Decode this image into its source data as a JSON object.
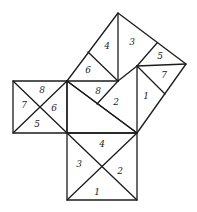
{
  "diagram": {
    "type": "pythagorean-dissection",
    "stroke_color": "#1c1c1c",
    "background": "#ffffff",
    "squares": {
      "hypotenuse_square": {
        "pieces": [
          {
            "id": "hyp-1",
            "label": "1",
            "x": 146,
            "y": 96
          },
          {
            "id": "hyp-2",
            "label": "2",
            "x": 116,
            "y": 102
          },
          {
            "id": "hyp-3",
            "label": "3",
            "x": 132,
            "y": 42
          },
          {
            "id": "hyp-4",
            "label": "4",
            "x": 107,
            "y": 46
          },
          {
            "id": "hyp-5",
            "label": "5",
            "x": 160,
            "y": 56
          },
          {
            "id": "hyp-6",
            "label": "6",
            "x": 88,
            "y": 70
          },
          {
            "id": "hyp-7",
            "label": "7",
            "x": 164,
            "y": 75
          },
          {
            "id": "hyp-8",
            "label": "8",
            "x": 98,
            "y": 91
          }
        ]
      },
      "left_square": {
        "pieces": [
          {
            "id": "left-5",
            "label": "5",
            "x": 37,
            "y": 124
          },
          {
            "id": "left-6",
            "label": "6",
            "x": 54,
            "y": 108
          },
          {
            "id": "left-7",
            "label": "7",
            "x": 24,
            "y": 105
          },
          {
            "id": "left-8",
            "label": "8",
            "x": 42,
            "y": 90
          }
        ]
      },
      "bottom_square": {
        "pieces": [
          {
            "id": "bot-1",
            "label": "1",
            "x": 97,
            "y": 192
          },
          {
            "id": "bot-2",
            "label": "2",
            "x": 120,
            "y": 171
          },
          {
            "id": "bot-3",
            "label": "3",
            "x": 79,
            "y": 164
          },
          {
            "id": "bot-4",
            "label": "4",
            "x": 102,
            "y": 144
          }
        ]
      }
    }
  }
}
